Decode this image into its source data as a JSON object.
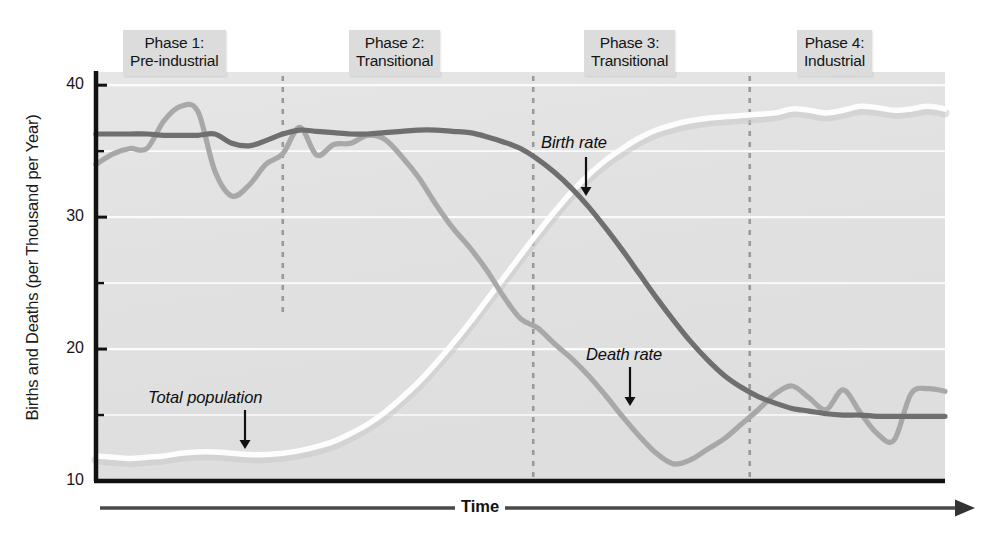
{
  "figure": {
    "y_axis_title": "Births and Deaths (per Thousand per Year)",
    "x_axis_title": "Time"
  },
  "phases": [
    {
      "name": "phase-1",
      "line1": "Phase 1:",
      "line2": "Pre-industrial",
      "x_center": 188,
      "box_left": 123,
      "box_top": 30
    },
    {
      "name": "phase-2",
      "line1": "Phase 2:",
      "line2": "Transitional",
      "x_center": 406,
      "box_left": 349,
      "box_top": 30
    },
    {
      "name": "phase-3",
      "line1": "Phase 3:",
      "line2": "Transitional",
      "x_center": 641,
      "box_left": 584,
      "box_top": 30
    },
    {
      "name": "phase-4",
      "line1": "Phase 4:",
      "line2": "Industrial",
      "x_center": 848,
      "box_left": 797,
      "box_top": 30
    }
  ],
  "annotations": [
    {
      "name": "birth-rate-label",
      "text": "Birth rate",
      "x": 541,
      "y": 133,
      "arrow_x": 586,
      "arrow_y0": 157,
      "arrow_y1": 196
    },
    {
      "name": "death-rate-label",
      "text": "Death rate",
      "x": 586,
      "y": 345,
      "arrow_x": 630,
      "arrow_y0": 367,
      "arrow_y1": 406
    },
    {
      "name": "total-population-label",
      "text": "Total population",
      "x": 148,
      "y": 388,
      "arrow_x": 245,
      "arrow_y0": 410,
      "arrow_y1": 449
    }
  ],
  "colors": {
    "plot_background": "#e2e2e2",
    "gridline": "#fbfbfb",
    "axis": "#111111",
    "birth_rate": "#6f6f6f",
    "death_rate": "#a8a8a8",
    "total_population": "#fdfdfd",
    "total_population_shadow": "#c8c8c8",
    "phase_divider": "#9a9a9a",
    "phase_box": "#dcdcdc"
  },
  "chart_data": {
    "type": "line",
    "title": "",
    "xlabel": "Time",
    "ylabel": "Births and Deaths (per Thousand per Year)",
    "ylim": [
      10,
      41
    ],
    "xlim": [
      0,
      100
    ],
    "yticks": [
      10,
      20,
      30,
      40
    ],
    "ytick_labels": [
      "10",
      "20",
      "30",
      "40"
    ],
    "yticks_minor": [
      15,
      25,
      35
    ],
    "grid": "horizontal",
    "legend": "inline-annotations",
    "xticks": [],
    "phase_boundaries": [
      22,
      51.5,
      77
    ],
    "series": [
      {
        "name": "Birth rate",
        "color": "#6f6f6f",
        "x": [
          0,
          2,
          4,
          6,
          8,
          10,
          12,
          14,
          16,
          18,
          20,
          22,
          24,
          26,
          28,
          30,
          32,
          34,
          36,
          38,
          40,
          42,
          44,
          46,
          48,
          50,
          52,
          54,
          56,
          58,
          60,
          62,
          64,
          66,
          68,
          70,
          72,
          74,
          76,
          78,
          80,
          82,
          84,
          86,
          88,
          90,
          92,
          94,
          96,
          98,
          100
        ],
        "values": [
          36.3,
          36.3,
          36.3,
          36.3,
          36.2,
          36.2,
          36.2,
          36.3,
          35.6,
          35.4,
          35.8,
          36.3,
          36.6,
          36.5,
          36.4,
          36.3,
          36.3,
          36.4,
          36.5,
          36.6,
          36.6,
          36.5,
          36.4,
          36.1,
          35.7,
          35.2,
          34.4,
          33.4,
          32.2,
          30.8,
          29.2,
          27.5,
          25.7,
          23.9,
          22.2,
          20.6,
          19.2,
          18.0,
          17.1,
          16.4,
          15.9,
          15.5,
          15.3,
          15.1,
          15.0,
          15.0,
          14.9,
          14.9,
          14.9,
          14.9,
          14.9
        ]
      },
      {
        "name": "Death rate",
        "color": "#a8a8a8",
        "x": [
          0,
          2,
          4,
          6,
          8,
          10,
          12,
          14,
          16,
          18,
          20,
          22,
          24,
          26,
          28,
          30,
          32,
          34,
          36,
          38,
          40,
          42,
          44,
          46,
          48,
          50,
          52,
          54,
          56,
          58,
          60,
          62,
          64,
          66,
          68,
          70,
          72,
          74,
          76,
          78,
          80,
          82,
          84,
          86,
          88,
          90,
          92,
          94,
          96,
          98,
          100
        ],
        "values": [
          34.0,
          34.8,
          35.2,
          35.2,
          37.3,
          38.4,
          38.0,
          33.5,
          31.6,
          32.4,
          34.0,
          34.8,
          36.8,
          34.7,
          35.5,
          35.6,
          36.2,
          35.9,
          34.6,
          33.0,
          31.0,
          29.2,
          27.7,
          26.0,
          24.0,
          22.3,
          21.6,
          20.4,
          19.3,
          18.0,
          16.5,
          14.9,
          13.4,
          12.1,
          11.3,
          11.6,
          12.4,
          13.2,
          14.3,
          15.4,
          16.6,
          17.2,
          16.3,
          15.4,
          16.9,
          15.2,
          13.6,
          13.1,
          16.6,
          17.0,
          16.8
        ]
      },
      {
        "name": "Total population",
        "color": "#fdfdfd",
        "x": [
          0,
          2,
          4,
          6,
          8,
          10,
          12,
          14,
          16,
          18,
          20,
          22,
          24,
          26,
          28,
          30,
          32,
          34,
          36,
          38,
          40,
          42,
          44,
          46,
          48,
          50,
          52,
          54,
          56,
          58,
          60,
          62,
          64,
          66,
          68,
          70,
          72,
          74,
          76,
          78,
          80,
          82,
          84,
          86,
          88,
          90,
          92,
          94,
          96,
          98,
          100
        ],
        "values": [
          11.9,
          11.8,
          11.7,
          11.8,
          11.9,
          12.1,
          12.2,
          12.2,
          12.1,
          12.0,
          12.0,
          12.1,
          12.3,
          12.6,
          13.0,
          13.6,
          14.3,
          15.2,
          16.3,
          17.5,
          18.9,
          20.4,
          22.0,
          23.7,
          25.4,
          27.1,
          28.8,
          30.4,
          31.9,
          33.2,
          34.3,
          35.2,
          36.0,
          36.6,
          37.0,
          37.3,
          37.5,
          37.6,
          37.7,
          37.8,
          37.9,
          38.2,
          38.1,
          37.9,
          38.1,
          38.4,
          38.3,
          38.1,
          38.2,
          38.4,
          38.2
        ]
      }
    ]
  },
  "plot_geometry": {
    "left": 96,
    "right": 945,
    "top": 72,
    "bottom": 481,
    "y_min": 10,
    "y_max": 41,
    "time_axis_y": 508,
    "time_axis_left": 100,
    "time_axis_right": 975
  }
}
